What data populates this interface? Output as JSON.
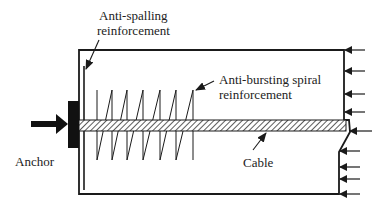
{
  "diagram": {
    "type": "post-tensioned anchorage zone schematic",
    "labels": {
      "anti_spalling_line1": "Anti-spalling",
      "anti_spalling_line2": "reinforcement",
      "anti_bursting_line1": "Anti-bursting spiral",
      "anti_bursting_line2": "reinforcement",
      "anchor": "Anchor",
      "cable": "Cable"
    },
    "components": [
      {
        "id": "concrete-block",
        "desc": "rectangular anchorage zone outline"
      },
      {
        "id": "anchor-plate",
        "desc": "solid black bearing plate at left face"
      },
      {
        "id": "anchor-force-arrow",
        "desc": "thick arrow pushing into anchor"
      },
      {
        "id": "anti-spalling-bar",
        "desc": "vertical bar just inside left face"
      },
      {
        "id": "spiral",
        "desc": "zigzag spiral reinforcement, 7 turns"
      },
      {
        "id": "cable",
        "desc": "hatched tendon running left to right"
      },
      {
        "id": "reaction-arrows",
        "desc": "9 leftward arrows on right face"
      }
    ],
    "colors": {
      "stroke": "#1a1a1a",
      "text": "#222222",
      "background": "#ffffff"
    }
  }
}
